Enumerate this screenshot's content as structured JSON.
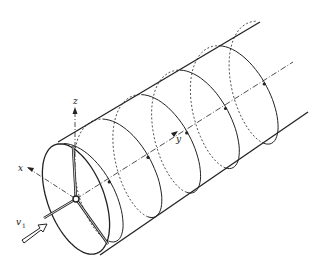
{
  "figure": {
    "axes": {
      "x_label": "x",
      "y_label": "y",
      "z_label": "z"
    },
    "inflow_label": "v",
    "inflow_subscript": "1",
    "rotor_blades": 3,
    "helix_turns": 5,
    "colors": {
      "stroke": "#222222",
      "background": "#ffffff"
    }
  }
}
